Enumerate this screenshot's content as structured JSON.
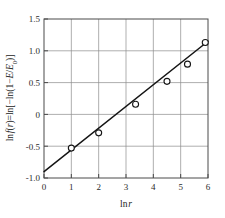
{
  "chart_data": {
    "type": "scatter",
    "title": "",
    "subtitle": "",
    "xlabel": "ln r",
    "ylabel": "ln f(r)=ln[-ln(1-E/E0)]",
    "ylabel_parts": {
      "lead": "ln",
      "f_sym": "f",
      "open_paren": "(",
      "r_sym": "r",
      "close_paren": ")",
      "equals": "=ln[−ln(1−",
      "E_sym": "E",
      "slash": "/",
      "E0_sym": "E",
      "E0_sub": "0",
      "tail": ")]"
    },
    "xlim": [
      0,
      6
    ],
    "ylim": [
      -1.0,
      1.5
    ],
    "xticks": [
      0,
      1,
      2,
      3,
      4,
      5,
      6
    ],
    "xtick_labels": [
      "0",
      "1",
      "2",
      "3",
      "4",
      "5",
      "6"
    ],
    "yticks": [
      -1.0,
      -0.5,
      0,
      0.5,
      1.0,
      1.5
    ],
    "ytick_labels": [
      "-1.0",
      "-0.5",
      "0",
      "0.5",
      "1.0",
      "1.5"
    ],
    "grid": true,
    "grid_color": "#8d8d8d",
    "legend": null,
    "legend_position": "none",
    "marker_style": "open-circle",
    "marker_color": "#151515",
    "marker_fill": "#ffffff",
    "line_color": "#151515",
    "x": [
      1.0,
      2.0,
      3.35,
      4.5,
      5.25,
      5.9
    ],
    "y": [
      -0.53,
      -0.29,
      0.16,
      0.52,
      0.79,
      1.13
    ],
    "points": [
      {
        "x": 1.0,
        "y": -0.53
      },
      {
        "x": 2.0,
        "y": -0.29
      },
      {
        "x": 3.35,
        "y": 0.16
      },
      {
        "x": 4.5,
        "y": 0.52
      },
      {
        "x": 5.25,
        "y": 0.79
      },
      {
        "x": 5.9,
        "y": 1.13
      }
    ],
    "fit_line": {
      "type": "linear",
      "x_start": 0.0,
      "y_start": -0.9,
      "x_end": 6.0,
      "y_end": 1.15,
      "slope": 0.3417,
      "intercept": -0.9
    },
    "annotations": []
  }
}
